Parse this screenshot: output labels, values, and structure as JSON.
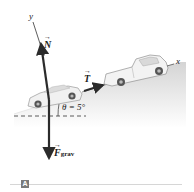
{
  "diagram": {
    "axes": {
      "y_label": "y",
      "x_label": "x"
    },
    "forces": [
      {
        "id": "normal",
        "symbol": "N",
        "subscript": "",
        "direction": "perpendicular to incline, up-left"
      },
      {
        "id": "tension",
        "symbol": "T",
        "subscript": "",
        "direction": "along incline, uphill"
      },
      {
        "id": "gravity",
        "symbol": "F",
        "subscript": "grav",
        "direction": "straight down"
      }
    ],
    "angle_label": "θ = 5°",
    "objects": [
      "car",
      "pickup truck",
      "tow rope",
      "incline"
    ],
    "panel_label": "A"
  },
  "colors": {
    "arrow": "#2b2b2b",
    "ground_shadow": "#cfcfcf",
    "panel_tag": "#7a7a7a"
  }
}
